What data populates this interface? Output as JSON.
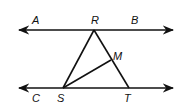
{
  "diagram": {
    "type": "geometry",
    "points": {
      "A": {
        "label": "A"
      },
      "B": {
        "label": "B"
      },
      "C": {
        "label": "C"
      },
      "R": {
        "label": "R"
      },
      "S": {
        "label": "S"
      },
      "T": {
        "label": "T"
      },
      "M": {
        "label": "M"
      }
    },
    "lines": [
      {
        "name": "line AB",
        "through": [
          "A",
          "R",
          "B"
        ],
        "arrows": "both"
      },
      {
        "name": "line CT",
        "through": [
          "C",
          "S",
          "T"
        ],
        "arrows": "both"
      }
    ],
    "segments": [
      {
        "from": "R",
        "to": "S"
      },
      {
        "from": "R",
        "to": "T"
      },
      {
        "from": "S",
        "to": "M"
      }
    ],
    "colors": {
      "stroke": "#111111",
      "background": "#ffffff"
    }
  }
}
